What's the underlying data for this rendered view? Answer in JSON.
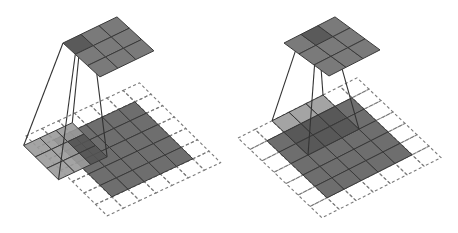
{
  "colors": {
    "input": "#6e6e6e",
    "kernel_overlap": "#555555",
    "kernel_padding": "#9a9a9a",
    "output": "#7a7a7a",
    "output_active": "#5a5a5a",
    "grid_line": "#3a3a3a",
    "padding_dash": "#7a7a7a",
    "projection_line": "#333333"
  },
  "panels": [
    {
      "name": "full-padding",
      "input_size": 5,
      "padding": 1,
      "padded_size": 7,
      "kernel_size": 3,
      "kernel_offset": [
        -0.5,
        0.5
      ],
      "output_size": 3,
      "output_active_cell": [
        0,
        0
      ]
    },
    {
      "name": "same-padding",
      "input_size": 5,
      "padding": 1,
      "padded_size": 7,
      "kernel_size": 3,
      "kernel_offset": [
        2,
        0
      ],
      "output_size": 3,
      "output_active_cell": [
        1,
        0
      ]
    }
  ]
}
